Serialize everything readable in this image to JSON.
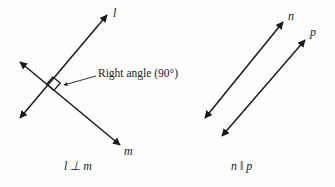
{
  "figure": {
    "background_color": "#fefefe",
    "stroke_color": "#1a1a1a",
    "width": 335,
    "height": 187
  },
  "left_panel": {
    "name": "perpendicular-lines-panel",
    "caption": "l ⊥ m",
    "annotation": "Right angle (90°)",
    "angle_value": "90°",
    "line_labels": {
      "line_l": "l",
      "line_m": "m"
    },
    "right_angle_marker": "square-marker"
  },
  "right_panel": {
    "name": "parallel-lines-panel",
    "caption": "n ‖ p",
    "line_labels": {
      "line_n": "n",
      "line_p": "p"
    }
  },
  "geometry": {
    "line_l": {
      "x1": 20,
      "y1": 118,
      "x2": 107,
      "y2": 15,
      "arrows": "both"
    },
    "line_m": {
      "x1": 20,
      "y1": 62,
      "x2": 120,
      "y2": 145,
      "arrows": "both"
    },
    "line_n": {
      "x1": 205,
      "y1": 118,
      "x2": 283,
      "y2": 22,
      "arrows": "both"
    },
    "line_p": {
      "x1": 222,
      "y1": 136,
      "x2": 305,
      "y2": 40,
      "arrows": "both"
    },
    "pointer": {
      "x1": 96,
      "y1": 76,
      "x2": 63,
      "y2": 85,
      "arrows": "start"
    },
    "intersection": {
      "x": 53,
      "y": 85
    }
  }
}
